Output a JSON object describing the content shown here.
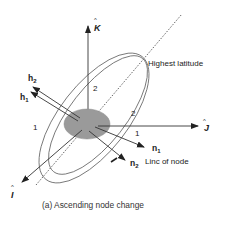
{
  "diagram": {
    "caption": "(a) Ascending node change",
    "axes": {
      "k_label": "K",
      "j_label": "J",
      "i_label": "I",
      "hat": "^"
    },
    "vectors": {
      "h1": {
        "base": "h",
        "sub": "1"
      },
      "h2": {
        "base": "h",
        "sub": "2"
      },
      "n1": {
        "base": "n",
        "sub": "1"
      },
      "n2": {
        "base": "n",
        "sub": "2"
      }
    },
    "annotations": {
      "highest_latitude": "Highest latitude",
      "line_of_node": "Linc of node"
    },
    "orbit_labels": {
      "orbit1_left": "1",
      "orbit1_right": "1",
      "orbit2_top": "2",
      "orbit2_right": "2"
    },
    "colors": {
      "line": "#333333",
      "earth_fill": "#9a9a9a",
      "orbit_stroke": "#666666"
    }
  }
}
